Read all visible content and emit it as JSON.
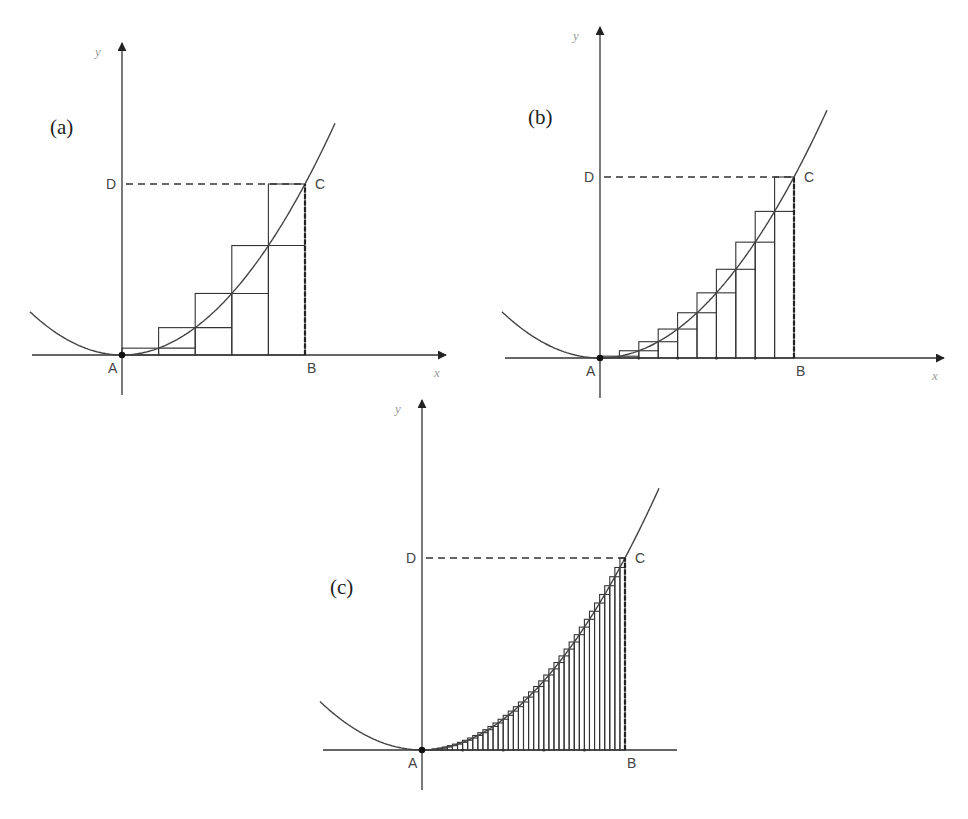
{
  "figure": {
    "panels": [
      {
        "id": "a",
        "label": "(a)",
        "rect_count": 5,
        "axis_labels": {
          "x": "x",
          "y": "y"
        },
        "points": {
          "A": "A",
          "B": "B",
          "C": "C",
          "D": "D"
        },
        "geometry": {
          "ax": 122,
          "ay": 355,
          "bx": 305,
          "cy": 184,
          "yTop": 43,
          "yBottom": 395,
          "xLeft": 32,
          "xRight": 446,
          "curveLeft": 30,
          "curveRight": 335,
          "labelX": 50,
          "labelY": 134,
          "xArrow": true
        }
      },
      {
        "id": "b",
        "label": "(b)",
        "rect_count": 10,
        "axis_labels": {
          "x": "x",
          "y": "y"
        },
        "points": {
          "A": "A",
          "B": "B",
          "C": "C",
          "D": "D"
        },
        "geometry": {
          "ax": 600,
          "ay": 358,
          "bx": 794,
          "cy": 177,
          "yTop": 27,
          "yBottom": 398,
          "xLeft": 505,
          "xRight": 944,
          "curveLeft": 502,
          "curveRight": 827,
          "labelX": 528,
          "labelY": 124,
          "xArrow": true
        }
      },
      {
        "id": "c",
        "label": "(c)",
        "rect_count": 40,
        "axis_labels": {
          "x": "",
          "y": "y"
        },
        "points": {
          "A": "A",
          "B": "B",
          "C": "C",
          "D": "D"
        },
        "geometry": {
          "ax": 422,
          "ay": 750,
          "bx": 625,
          "cy": 558,
          "yTop": 400,
          "yBottom": 790,
          "xLeft": 323,
          "xRight": 677,
          "curveLeft": 320,
          "curveRight": 659,
          "labelX": 330,
          "labelY": 594,
          "xArrow": false
        }
      }
    ],
    "caption": ""
  }
}
